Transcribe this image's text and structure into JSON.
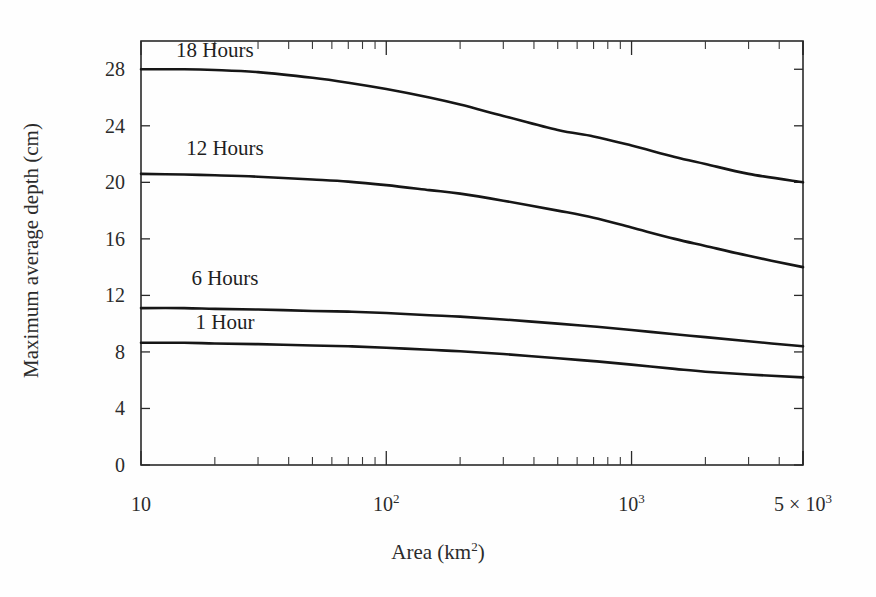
{
  "chart_data": {
    "type": "line",
    "title": "",
    "xlabel": "Area (km2)",
    "xlabel_base": "Area (km",
    "xlabel_sup": "2",
    "xlabel_tail": ")",
    "ylabel": "Maximum average depth (cm)",
    "xscale": "log",
    "xlim": [
      10,
      5000
    ],
    "ylim": [
      0,
      30
    ],
    "grid": false,
    "legend": "inline-curve-labels",
    "ytick_labels": [
      "0",
      "4",
      "8",
      "12",
      "16",
      "20",
      "24",
      "28"
    ],
    "ytick_values": [
      0,
      4,
      8,
      12,
      16,
      20,
      24,
      28
    ],
    "xtick_labels": [
      "10",
      "102",
      "103",
      "5 x 103"
    ],
    "xtick_values": [
      10,
      100,
      1000,
      5000
    ],
    "xtick_label_parts": [
      {
        "base": "10",
        "sup": ""
      },
      {
        "base": "10",
        "sup": "2"
      },
      {
        "base": "10",
        "sup": "3"
      },
      {
        "base": "5 × 10",
        "sup": "3"
      }
    ],
    "x": [
      10,
      15,
      20,
      30,
      50,
      70,
      100,
      150,
      200,
      300,
      500,
      700,
      1000,
      1500,
      2000,
      3000,
      5000
    ],
    "series": [
      {
        "name": "18 Hours",
        "label": "18 Hours",
        "label_x": 20,
        "label_y": 29.2,
        "values": [
          28.0,
          28.0,
          27.95,
          27.8,
          27.4,
          27.05,
          26.6,
          26.0,
          25.5,
          24.7,
          23.7,
          23.25,
          22.6,
          21.8,
          21.3,
          20.6,
          20.0
        ]
      },
      {
        "name": "12 Hours",
        "label": "12 Hours",
        "label_x": 22,
        "label_y": 22.3,
        "values": [
          20.6,
          20.55,
          20.5,
          20.4,
          20.2,
          20.05,
          19.8,
          19.45,
          19.2,
          18.7,
          18.0,
          17.5,
          16.8,
          16.0,
          15.5,
          14.8,
          14.0
        ]
      },
      {
        "name": "6 Hours",
        "label": "6 Hours",
        "label_x": 22,
        "label_y": 13.1,
        "values": [
          11.1,
          11.1,
          11.05,
          11.0,
          10.9,
          10.85,
          10.75,
          10.6,
          10.5,
          10.3,
          10.0,
          9.8,
          9.55,
          9.25,
          9.05,
          8.75,
          8.4
        ]
      },
      {
        "name": "1 Hour",
        "label": "1 Hour",
        "label_x": 22,
        "label_y": 10.0,
        "values": [
          8.65,
          8.65,
          8.6,
          8.55,
          8.45,
          8.4,
          8.3,
          8.15,
          8.05,
          7.85,
          7.55,
          7.35,
          7.1,
          6.8,
          6.6,
          6.4,
          6.2
        ]
      }
    ],
    "colors": {
      "curve": "#161616",
      "axis": "#2a2a2a",
      "text": "#2b2b2b",
      "background": "#fefefe"
    }
  }
}
